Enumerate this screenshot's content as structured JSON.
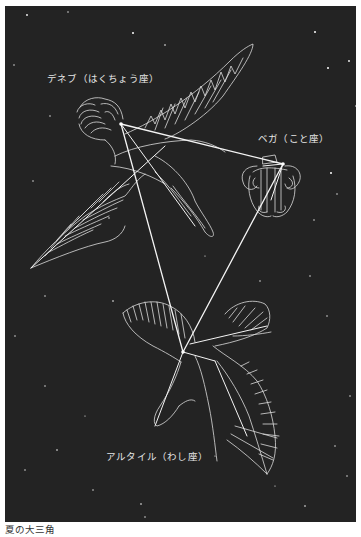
{
  "figure": {
    "title": "夏の大三角",
    "background_color": "#232323",
    "line_color": "#f2f2f2",
    "labels": {
      "deneb": "デネブ（はくちょう座）",
      "vega": "ベガ（こと座）",
      "altair": "アルタイル（わし座）"
    },
    "stars": [
      {
        "name": "Deneb",
        "constellation": "はくちょう座"
      },
      {
        "name": "Vega",
        "constellation": "こと座"
      },
      {
        "name": "Altair",
        "constellation": "わし座"
      }
    ]
  },
  "caption": "夏の大三角"
}
